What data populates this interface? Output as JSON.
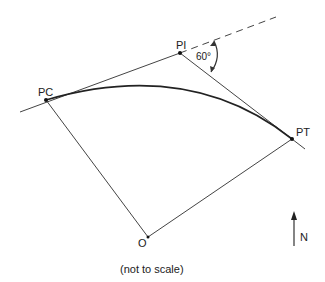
{
  "diagram": {
    "labels": {
      "pc": "PC",
      "pi": "PI",
      "pt": "PT",
      "o": "O",
      "angle": "60°",
      "north": "N",
      "note": "(not to scale)"
    },
    "colors": {
      "line": "#333333",
      "background": "#ffffff"
    }
  }
}
